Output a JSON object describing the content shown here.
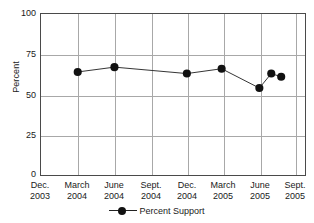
{
  "chart_data": {
    "type": "line",
    "title": "",
    "xlabel": "",
    "ylabel": "Percent",
    "ylim": [
      0,
      100
    ],
    "yticks": [
      0,
      25,
      50,
      75,
      100
    ],
    "grid": true,
    "legend_position": "bottom",
    "categories": [
      "Dec. 2003",
      "March 2004",
      "June 2004",
      "Sept. 2004",
      "Dec. 2004",
      "March 2005",
      "June 2005",
      "Sept. 2005"
    ],
    "xtick_labels": [
      {
        "line1": "Dec.",
        "line2": "2003"
      },
      {
        "line1": "March",
        "line2": "2004"
      },
      {
        "line1": "June",
        "line2": "2004"
      },
      {
        "line1": "Sept.",
        "line2": "2004"
      },
      {
        "line1": "Dec.",
        "line2": "2004"
      },
      {
        "line1": "March",
        "line2": "2005"
      },
      {
        "line1": "June",
        "line2": "2005"
      },
      {
        "line1": "Sept.",
        "line2": "2005"
      }
    ],
    "series": [
      {
        "name": "Percent Support",
        "marker": "filled-circle",
        "color": "#111111",
        "points": [
          {
            "x_label": "March 2004",
            "x_frac": 0.1391,
            "y": 64
          },
          {
            "x_label": "June 2004",
            "x_frac": 0.2782,
            "y": 67
          },
          {
            "x_label": "Dec. 2004",
            "x_frac": 0.5526,
            "y": 63
          },
          {
            "x_label": "March 2005",
            "x_frac": 0.6842,
            "y": 66
          },
          {
            "x_label": "June 2005",
            "x_frac": 0.8271,
            "y": 54
          },
          {
            "x_label": "July 2005",
            "x_frac": 0.8722,
            "y": 63
          },
          {
            "x_label": "August 2005",
            "x_frac": 0.9098,
            "y": 61
          }
        ]
      }
    ]
  },
  "legend": {
    "label": "Percent Support"
  },
  "colors": {
    "marker": "#111111",
    "line": "#333333",
    "grid": "#a8a8a8",
    "axis": "#4a4a4a",
    "text": "#1a1a1a"
  }
}
